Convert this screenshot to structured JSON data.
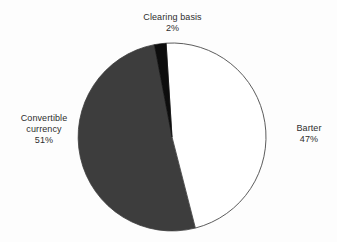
{
  "chart_data": {
    "type": "pie",
    "title": "",
    "categories": [
      "Barter",
      "Convertible currency",
      "Clearing basis"
    ],
    "values": [
      47,
      51,
      2
    ],
    "unit": "%",
    "legend": "none",
    "labels_position": "outside",
    "slices": [
      {
        "name": "Barter",
        "value": 47,
        "label": "Barter",
        "value_label": "47%",
        "color": "#ffffff",
        "stroke": "#4a4a4a",
        "start_angle_deg": 3.6,
        "end_angle_deg": 172.8
      },
      {
        "name": "Convertible currency",
        "value": 51,
        "label_line1": "Convertible",
        "label_line2": "currency",
        "value_label": "51%",
        "color": "#3d3d3d",
        "stroke": "#3d3d3d",
        "start_angle_deg": 172.8,
        "end_angle_deg": 356.4
      },
      {
        "name": "Clearing basis",
        "value": 2,
        "label": "Clearing basis",
        "value_label": "2%",
        "color": "#0d0d0d",
        "stroke": "#0d0d0d",
        "start_angle_deg": 356.4,
        "end_angle_deg": 3.6
      }
    ],
    "colors": {
      "barter": "#ffffff",
      "convertible_currency": "#3d3d3d",
      "clearing_basis": "#0d0d0d",
      "outline": "#4a4a4a",
      "background": "#fdfdfd",
      "text": "#2d2d2d"
    },
    "geometry": {
      "center_x": 172,
      "center_y": 137,
      "radius": 94
    }
  },
  "labels": {
    "clearing": {
      "name": "Clearing basis",
      "value": "2%"
    },
    "convertible": {
      "name_line1": "Convertible",
      "name_line2": "currency",
      "value": "51%"
    },
    "barter": {
      "name": "Barter",
      "value": "47%"
    }
  }
}
